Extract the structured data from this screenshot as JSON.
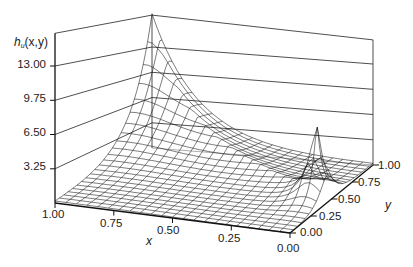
{
  "chart_data": {
    "type": "surface3d",
    "title": "",
    "zlabel": "h_u(x,y)",
    "xlabel": "x",
    "ylabel": "y",
    "x_ticks": [
      "1.00",
      "0.75",
      "0.50",
      "0.25",
      "0.00"
    ],
    "y_ticks": [
      "0.00",
      "0.25",
      "0.50",
      "0.75",
      "1.00"
    ],
    "z_ticks": [
      "3.25",
      "6.50",
      "9.75",
      "13.00"
    ],
    "x_range": [
      0,
      1
    ],
    "y_range": [
      0,
      1
    ],
    "z_range": [
      0,
      14.5
    ],
    "grid": true,
    "peaks": [
      {
        "x": 1.0,
        "y": 1.0,
        "z": 13.0
      },
      {
        "x": 0.05,
        "y": 0.45,
        "z": 8.0
      }
    ]
  },
  "axes": {
    "z_label_main": "h",
    "z_label_sub": "u",
    "z_label_args": "(x,y)",
    "x_name": "x",
    "y_name": "y"
  }
}
